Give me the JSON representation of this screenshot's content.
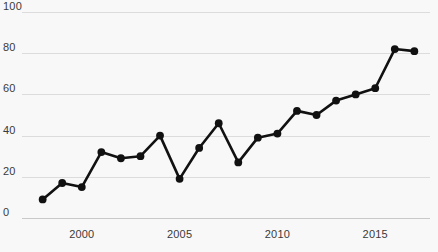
{
  "chart_data": {
    "type": "line",
    "title": "",
    "subtitle": "",
    "xlabel": "",
    "ylabel": "",
    "xlim": [
      1997.2,
      2017.8
    ],
    "ylim": [
      0,
      100
    ],
    "grid": true,
    "legend": false,
    "legend_position": "none",
    "marker": "circle",
    "line_color": "#111111",
    "marker_color": "#111111",
    "background_color": "#f8f8f8",
    "gridline_color": "#dcdcdc",
    "axis_color": "#c9c9c9",
    "text_color": "#3a3a3a",
    "y_ticks": [
      0,
      20,
      40,
      60,
      80,
      100
    ],
    "y_tick_labels": [
      "0",
      "20",
      "40",
      "60",
      "80",
      "100"
    ],
    "x_ticks": [
      2000,
      2005,
      2010,
      2015
    ],
    "x_tick_labels": [
      "2000",
      "2005",
      "2010",
      "2015"
    ],
    "x": [
      1998,
      1999,
      2000,
      2001,
      2002,
      2003,
      2004,
      2005,
      2006,
      2007,
      2008,
      2009,
      2010,
      2011,
      2012,
      2013,
      2014,
      2015,
      2016,
      2017
    ],
    "values": [
      9,
      17,
      15,
      32,
      29,
      30,
      40,
      19,
      34,
      46,
      27,
      39,
      41,
      52,
      50,
      57,
      60,
      63,
      82,
      81
    ],
    "series": [
      {
        "name": "series-1",
        "values": [
          9,
          17,
          15,
          32,
          29,
          30,
          40,
          19,
          34,
          46,
          27,
          39,
          41,
          52,
          50,
          57,
          60,
          63,
          82,
          81
        ]
      }
    ],
    "points": [
      {
        "x": 1998,
        "y": 9
      },
      {
        "x": 1999,
        "y": 17
      },
      {
        "x": 2000,
        "y": 15
      },
      {
        "x": 2001,
        "y": 32
      },
      {
        "x": 2002,
        "y": 29
      },
      {
        "x": 2003,
        "y": 30
      },
      {
        "x": 2004,
        "y": 40
      },
      {
        "x": 2005,
        "y": 19
      },
      {
        "x": 2006,
        "y": 34
      },
      {
        "x": 2007,
        "y": 46
      },
      {
        "x": 2008,
        "y": 27
      },
      {
        "x": 2009,
        "y": 39
      },
      {
        "x": 2010,
        "y": 41
      },
      {
        "x": 2011,
        "y": 52
      },
      {
        "x": 2012,
        "y": 50
      },
      {
        "x": 2013,
        "y": 57
      },
      {
        "x": 2014,
        "y": 60
      },
      {
        "x": 2015,
        "y": 63
      },
      {
        "x": 2016,
        "y": 82
      },
      {
        "x": 2017,
        "y": 81
      }
    ]
  }
}
